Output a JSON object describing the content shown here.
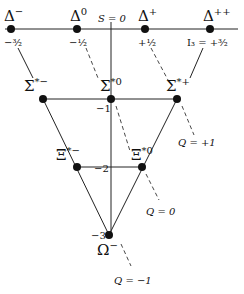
{
  "diagram": {
    "axes": {
      "strangeness_label": "S = 0",
      "isospin_label": "I₃ = +³⁄₂"
    },
    "rows": [
      {
        "strangeness": "0",
        "particles": [
          {
            "name": "Δ",
            "charge_sup": "−",
            "i3": "−³⁄₂"
          },
          {
            "name": "Δ",
            "charge_sup": "0",
            "i3": "−¹⁄₂"
          },
          {
            "name": "Δ",
            "charge_sup": "+",
            "i3": "+¹⁄₂"
          },
          {
            "name": "Δ",
            "charge_sup": "++",
            "i3": "I₃ = +³⁄₂"
          }
        ]
      },
      {
        "strangeness": "−1",
        "particles": [
          {
            "name": "Σ",
            "charge_sup": "*−"
          },
          {
            "name": "Σ",
            "charge_sup": "*0"
          },
          {
            "name": "Σ",
            "charge_sup": "*+"
          }
        ]
      },
      {
        "strangeness": "−2",
        "particles": [
          {
            "name": "Ξ",
            "charge_sup": "*−"
          },
          {
            "name": "Ξ",
            "charge_sup": "*0"
          }
        ]
      },
      {
        "strangeness": "−3",
        "particles": [
          {
            "name": "Ω",
            "charge_sup": "−"
          }
        ]
      }
    ],
    "charge_lines": [
      {
        "label": "Q = +1"
      },
      {
        "label": "Q = 0"
      },
      {
        "label": "Q = −1"
      }
    ]
  }
}
